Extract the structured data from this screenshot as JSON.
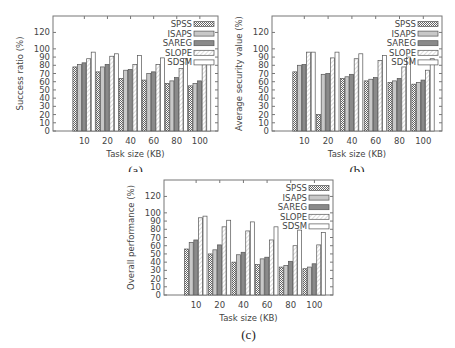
{
  "legend": [
    "SPSS",
    "ISAPS",
    "SAREG",
    "SLOPE",
    "SDSM"
  ],
  "series_styles": {
    "SPSS": {
      "pattern": "checker",
      "fill": "#9a9a9a"
    },
    "ISAPS": {
      "pattern": "light",
      "fill": "#c8c8c8"
    },
    "SAREG": {
      "pattern": "dark",
      "fill": "#8a8a8a"
    },
    "SLOPE": {
      "pattern": "hatch",
      "fill": "#ffffff"
    },
    "SDSM": {
      "pattern": "empty",
      "fill": "#ffffff"
    }
  },
  "chart_data": [
    {
      "id": "a",
      "type": "bar",
      "caption": "(a)",
      "title": "",
      "xlabel": "Task size (KB)",
      "ylabel": "Success ratio (%)",
      "categories": [
        "10",
        "20",
        "40",
        "60",
        "80",
        "100"
      ],
      "yticks": [
        0,
        10,
        20,
        30,
        40,
        50,
        60,
        70,
        80,
        90,
        100,
        120
      ],
      "ylim": [
        0,
        140
      ],
      "grid": false,
      "legend_position": "top-right",
      "series": [
        {
          "name": "SPSS",
          "values": [
            78,
            72,
            64,
            62,
            58,
            55
          ]
        },
        {
          "name": "ISAPS",
          "values": [
            81,
            78,
            74,
            70,
            61,
            58
          ]
        },
        {
          "name": "SAREG",
          "values": [
            83,
            81,
            75,
            72,
            65,
            61
          ]
        },
        {
          "name": "SLOPE",
          "values": [
            88,
            91,
            81,
            81,
            76,
            81
          ]
        },
        {
          "name": "SDSM",
          "values": [
            96,
            94,
            92,
            89,
            88,
            86
          ]
        }
      ]
    },
    {
      "id": "b",
      "type": "bar",
      "caption": "(b)",
      "title": "",
      "xlabel": "Task size (KB)",
      "ylabel": "Average security value (%)",
      "categories": [
        "10",
        "20",
        "40",
        "60",
        "80",
        "100"
      ],
      "yticks": [
        0,
        10,
        20,
        30,
        40,
        50,
        60,
        70,
        80,
        90,
        100,
        120
      ],
      "ylim": [
        0,
        140
      ],
      "grid": false,
      "legend_position": "top-right",
      "series": [
        {
          "name": "SPSS",
          "values": [
            72,
            20,
            64,
            61,
            59,
            57
          ]
        },
        {
          "name": "ISAPS",
          "values": [
            80,
            69,
            66,
            63,
            61,
            59
          ]
        },
        {
          "name": "SAREG",
          "values": [
            81,
            70,
            69,
            65,
            64,
            62
          ]
        },
        {
          "name": "SLOPE",
          "values": [
            96,
            89,
            88,
            86,
            78,
            74
          ]
        },
        {
          "name": "SDSM",
          "values": [
            96,
            96,
            94,
            92,
            90,
            88
          ]
        }
      ]
    },
    {
      "id": "c",
      "type": "bar",
      "caption": "(c)",
      "title": "",
      "xlabel": "Task size (KB)",
      "ylabel": "Overall performance (%)",
      "categories": [
        "10",
        "20",
        "40",
        "60",
        "80",
        "100"
      ],
      "yticks": [
        0,
        10,
        20,
        30,
        40,
        50,
        60,
        70,
        80,
        90,
        100,
        120
      ],
      "ylim": [
        0,
        140
      ],
      "grid": false,
      "legend_position": "top-right",
      "series": [
        {
          "name": "SPSS",
          "values": [
            56,
            50,
            40,
            37,
            34,
            32
          ]
        },
        {
          "name": "ISAPS",
          "values": [
            64,
            55,
            49,
            44,
            36,
            34
          ]
        },
        {
          "name": "SAREG",
          "values": [
            67,
            61,
            52,
            46,
            41,
            38
          ]
        },
        {
          "name": "SLOPE",
          "values": [
            94,
            83,
            78,
            67,
            60,
            61
          ]
        },
        {
          "name": "SDSM",
          "values": [
            96,
            91,
            89,
            83,
            79,
            76
          ]
        }
      ]
    }
  ]
}
